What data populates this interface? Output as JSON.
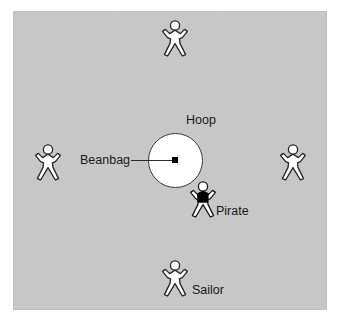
{
  "scene": {
    "background_color": "#ffffff",
    "panel_color": "#c7c7c7",
    "title": "Pirate and sailors circle game diagram"
  },
  "hoop": {
    "label": "Hoop",
    "fill_color": "#ffffff",
    "stroke_color": "#3a3a3a",
    "center_x": 175,
    "center_y": 160,
    "radius": 27
  },
  "beanbag": {
    "label": "Beanbag",
    "color": "#000000",
    "x": 175,
    "y": 160
  },
  "figures": [
    {
      "id": "figure-top",
      "role": "sailor",
      "label": "",
      "style": "outline",
      "x": 175,
      "y": 38
    },
    {
      "id": "figure-left",
      "role": "sailor",
      "label": "",
      "style": "outline",
      "x": 48,
      "y": 162
    },
    {
      "id": "figure-right",
      "role": "sailor",
      "label": "",
      "style": "outline",
      "x": 293,
      "y": 162
    },
    {
      "id": "figure-pirate",
      "role": "pirate",
      "label": "Pirate",
      "style": "filled-torso",
      "x": 203,
      "y": 197
    },
    {
      "id": "figure-sailor",
      "role": "sailor",
      "label": "Sailor",
      "style": "outline",
      "x": 175,
      "y": 278
    }
  ],
  "labels": {
    "hoop": "Hoop",
    "beanbag": "Beanbag",
    "pirate": "Pirate",
    "sailor": "Sailor"
  }
}
